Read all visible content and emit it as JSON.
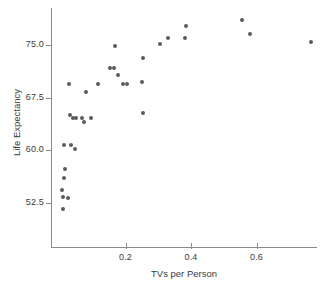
{
  "chart_data": {
    "type": "scatter",
    "title": "",
    "xlabel": "TVs per Person",
    "ylabel": "Life Expectancy",
    "xlim": [
      0.0,
      0.79
    ],
    "ylim": [
      50.0,
      80.5
    ],
    "grid": false,
    "legend": null,
    "xticks": [
      "0.2",
      "0.4",
      "0.6"
    ],
    "xtick_values": [
      0.2,
      0.4,
      0.6
    ],
    "yticks": [
      "52.5",
      "60.0",
      "67.5",
      "75.0"
    ],
    "ytick_values": [
      52.5,
      60.0,
      67.5,
      75.0
    ],
    "point_color": "#5b5b5f",
    "axis_color": "#8a8a8a",
    "points": [
      {
        "x": 0.01,
        "y": 51.6
      },
      {
        "x": 0.008,
        "y": 53.3
      },
      {
        "x": 0.007,
        "y": 54.3
      },
      {
        "x": 0.023,
        "y": 53.2
      },
      {
        "x": 0.013,
        "y": 56.1
      },
      {
        "x": 0.014,
        "y": 57.4
      },
      {
        "x": 0.011,
        "y": 60.7
      },
      {
        "x": 0.033,
        "y": 60.7
      },
      {
        "x": 0.046,
        "y": 60.2
      },
      {
        "x": 0.03,
        "y": 65.0
      },
      {
        "x": 0.041,
        "y": 64.6
      },
      {
        "x": 0.048,
        "y": 64.6
      },
      {
        "x": 0.066,
        "y": 64.6
      },
      {
        "x": 0.074,
        "y": 64.1
      },
      {
        "x": 0.094,
        "y": 64.6
      },
      {
        "x": 0.253,
        "y": 65.3
      },
      {
        "x": 0.027,
        "y": 69.4
      },
      {
        "x": 0.08,
        "y": 68.3
      },
      {
        "x": 0.115,
        "y": 69.4
      },
      {
        "x": 0.152,
        "y": 71.8
      },
      {
        "x": 0.165,
        "y": 71.8
      },
      {
        "x": 0.176,
        "y": 70.8
      },
      {
        "x": 0.192,
        "y": 69.4
      },
      {
        "x": 0.205,
        "y": 69.4
      },
      {
        "x": 0.25,
        "y": 69.8
      },
      {
        "x": 0.168,
        "y": 74.8
      },
      {
        "x": 0.253,
        "y": 73.2
      },
      {
        "x": 0.305,
        "y": 75.1
      },
      {
        "x": 0.33,
        "y": 76.0
      },
      {
        "x": 0.383,
        "y": 76.0
      },
      {
        "x": 0.385,
        "y": 77.7
      },
      {
        "x": 0.555,
        "y": 78.5
      },
      {
        "x": 0.58,
        "y": 76.6
      },
      {
        "x": 0.765,
        "y": 75.4
      }
    ]
  },
  "axes": {
    "y_title": "Life Expectancy",
    "x_title": "TVs per Person"
  }
}
